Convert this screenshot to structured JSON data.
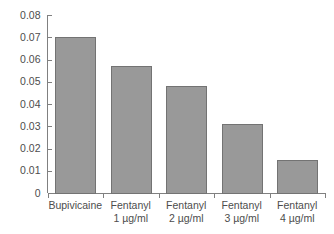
{
  "chart_data": {
    "type": "bar",
    "title": "",
    "subtitle": "",
    "xlabel": "",
    "ylabel": "",
    "categories": [
      "Bupivicaine",
      "Fentanyl 1 µg/ml",
      "Fentanyl 2 µg/ml",
      "Fentanyl 3 µg/ml",
      "Fentanyl 4 µg/ml"
    ],
    "category_lines": [
      [
        "Bupivicaine",
        ""
      ],
      [
        "Fentanyl",
        "1 µg/ml"
      ],
      [
        "Fentanyl",
        "2 µg/ml"
      ],
      [
        "Fentanyl",
        "3 µg/ml"
      ],
      [
        "Fentanyl",
        "4 µg/ml"
      ]
    ],
    "values": [
      0.07,
      0.057,
      0.048,
      0.031,
      0.015
    ],
    "ylim": [
      0,
      0.08
    ],
    "ytick_step": 0.01,
    "ytick_labels": [
      "0",
      "0.01",
      "0.02",
      "0.03",
      "0.04",
      "0.05",
      "0.06",
      "0.07",
      "0.08"
    ],
    "ytick_values": [
      0,
      0.01,
      0.02,
      0.03,
      0.04,
      0.05,
      0.06,
      0.07,
      0.08
    ],
    "grid": false,
    "legend": false,
    "legend_position": "none",
    "bar_fill_color": "#999999",
    "bar_edge_color": "#737373",
    "axis_color": "#808080",
    "text_color": "#4d4d4d",
    "background_color": "#ffffff"
  }
}
